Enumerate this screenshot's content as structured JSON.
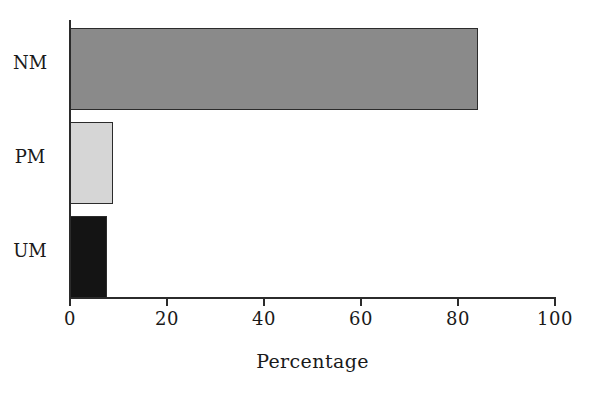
{
  "chart_data": {
    "type": "bar",
    "orientation": "horizontal",
    "title": "",
    "subtitle": "",
    "xlabel": "Percentage",
    "ylabel": "",
    "categories": [
      "NM",
      "PM",
      "UM"
    ],
    "values": [
      84.1,
      8.9,
      7.6
    ],
    "series": [
      {
        "name": "Percentage",
        "values": [
          84.1,
          8.9,
          7.6
        ]
      }
    ],
    "xlim": [
      0,
      100
    ],
    "xticks": [
      0,
      20,
      40,
      60,
      80,
      100
    ],
    "xtick_labels": [
      "0",
      "20",
      "40",
      "60",
      "80",
      "100"
    ],
    "ytick_labels": [
      "NM",
      "PM",
      "UM"
    ],
    "grid": false,
    "legend": false,
    "legend_position": "none",
    "bar_colors": [
      "#8a8a8a",
      "#d6d6d6",
      "#141414"
    ],
    "bar_edge_color": "#2b2b2b",
    "axis_color": "#2b2b2b",
    "background_color": "#ffffff",
    "text_color": "#1a1a1a"
  },
  "axes": {
    "x_title": "Percentage",
    "x_tick_labels": [
      "0",
      "20",
      "40",
      "60",
      "80",
      "100"
    ],
    "y_tick_labels": [
      "NM",
      "PM",
      "UM"
    ]
  },
  "bars": [
    {
      "category": "NM",
      "value": 84.1,
      "color": "#8a8a8a"
    },
    {
      "category": "PM",
      "value": 8.9,
      "color": "#d6d6d6"
    },
    {
      "category": "UM",
      "value": 7.6,
      "color": "#141414"
    }
  ]
}
